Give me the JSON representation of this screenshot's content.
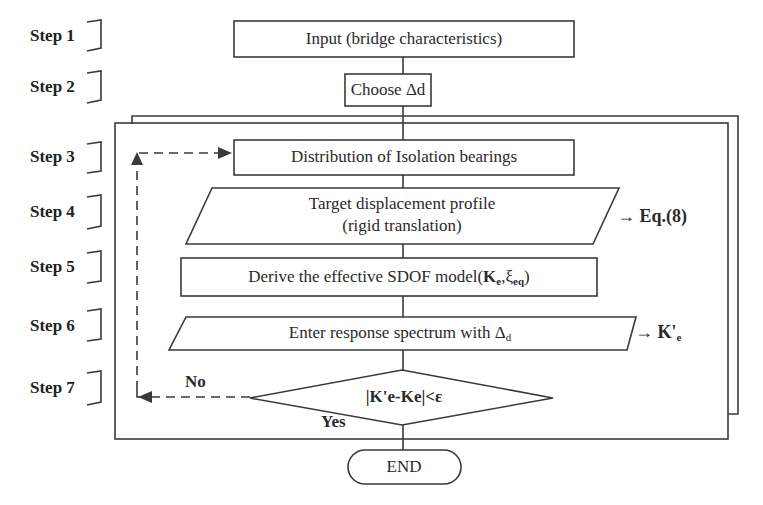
{
  "steps": [
    {
      "label": "Step 1",
      "y": 30
    },
    {
      "label": "Step 2",
      "y": 78
    },
    {
      "label": "Step 3",
      "y": 147
    },
    {
      "label": "Step 4",
      "y": 203
    },
    {
      "label": "Step 5",
      "y": 258
    },
    {
      "label": "Step 6",
      "y": 317
    },
    {
      "label": "Step 7",
      "y": 375
    }
  ],
  "nodes": {
    "input": {
      "text": "Input  (bridge characteristics)",
      "shape": "rectangle"
    },
    "choose": {
      "text_prefix": "Choose ",
      "text_symbol": "Δd",
      "shape": "rectangle"
    },
    "distribution": {
      "text": "Distribution of Isolation bearings",
      "shape": "rectangle"
    },
    "target": {
      "line1": "Target displacement profile",
      "line2": "(rigid translation)",
      "shape": "parallelogram"
    },
    "derive": {
      "text": "Derive the effective SDOF model(",
      "k": "K",
      "k_sub": "e",
      "sep": ",",
      "xi": "ξ",
      "xi_sub": "eq",
      "close": ")",
      "shape": "rectangle"
    },
    "enter": {
      "text": "Enter response spectrum with Δ",
      "sub": "d",
      "shape": "parallelogram"
    },
    "decision": {
      "text": "|K'e-Ke|<ε",
      "shape": "diamond"
    },
    "end": {
      "text": "END",
      "shape": "terminator"
    }
  },
  "annotations": {
    "eq": "→ Eq.(8)",
    "kprime": "→ K'",
    "kprime_sub": "e",
    "no": "No",
    "yes": "Yes"
  },
  "colors": {
    "stroke": "#3a3a3a",
    "text": "#2a2a2a",
    "background": "#ffffff"
  }
}
